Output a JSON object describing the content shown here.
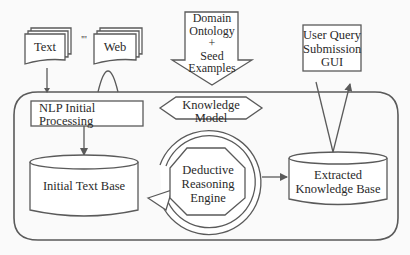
{
  "diagram": {
    "type": "system architecture flow diagram",
    "colors": {
      "stroke": "#5a5a5a",
      "fill": "#ffffff",
      "background": "#fafafa",
      "text": "#2a2a2a"
    },
    "inputs": {
      "text_doc": {
        "label": "Text"
      },
      "ellipsis": {
        "label": "'''"
      },
      "web_doc": {
        "label": "Web"
      },
      "domain_arrow": {
        "line1": "Domain",
        "line2": "Ontology",
        "line3": "+",
        "line4": "Seed",
        "line5": "Examples"
      },
      "user_query": {
        "line1": "User Query",
        "line2": "Submission",
        "line3": "GUI"
      }
    },
    "system": {
      "nlp": {
        "line1": "NLP Initial",
        "line2": "Processing"
      },
      "knowledge_model": {
        "line1": "Knowledge",
        "line2": "Model"
      },
      "initial_text_base": {
        "label": "Initial Text Base"
      },
      "reasoning_engine": {
        "line1": "Deductive",
        "line2": "Reasoning",
        "line3": "Engine"
      },
      "extracted_kb": {
        "line1": "Extracted",
        "line2": "Knowledge Base"
      }
    },
    "edges": [
      {
        "from": "Text",
        "to": "NLP Initial Processing"
      },
      {
        "from": "Web",
        "to": "NLP Initial Processing"
      },
      {
        "from": "Domain Ontology + Seed Examples",
        "to": "Knowledge Model"
      },
      {
        "from": "NLP Initial Processing",
        "to": "Initial Text Base"
      },
      {
        "from": "Deductive Reasoning Engine",
        "to": "Extracted Knowledge Base"
      },
      {
        "from": "User Query Submission GUI",
        "to": "Extracted Knowledge Base"
      },
      {
        "from": "Extracted Knowledge Base",
        "to": "User Query Submission GUI"
      },
      {
        "from": "Deductive Reasoning Engine",
        "to": "Deductive Reasoning Engine",
        "note": "circular loop arrow"
      }
    ]
  }
}
